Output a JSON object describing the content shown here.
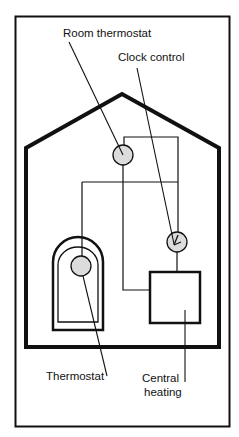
{
  "diagram": {
    "type": "heating-controls-layout",
    "labels": {
      "room_thermostat": "Room thermostat",
      "clock_control": "Clock control",
      "thermostat": "Thermostat",
      "central_heating_line1": "Central",
      "central_heating_line2": "heating"
    },
    "components": [
      {
        "id": "room-thermostat",
        "shape": "circle",
        "fill": "#dcdcdc"
      },
      {
        "id": "clock-control",
        "shape": "circle-with-hands",
        "fill": "#dcdcdc"
      },
      {
        "id": "cylinder-thermostat",
        "shape": "circle",
        "fill": "#dcdcdc"
      },
      {
        "id": "hot-water-cylinder",
        "shape": "arched-box"
      },
      {
        "id": "central-heating-boiler",
        "shape": "box"
      }
    ],
    "colors": {
      "stroke": "#111111",
      "component_fill": "#dcdcdc",
      "background": "#ffffff"
    }
  }
}
